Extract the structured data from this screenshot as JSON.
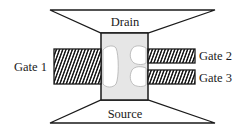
{
  "diagram": {
    "title": "",
    "labels": {
      "drain": "Drain",
      "source": "Source",
      "gate1": "Gate 1",
      "gate2": "Gate 2",
      "gate3": "Gate 3"
    },
    "colors": {
      "line": "#1a1a1a",
      "channel_fill": "#e6e6e6",
      "dot_fill": "#ffffff",
      "dot_stroke": "#b0b0b0"
    }
  }
}
